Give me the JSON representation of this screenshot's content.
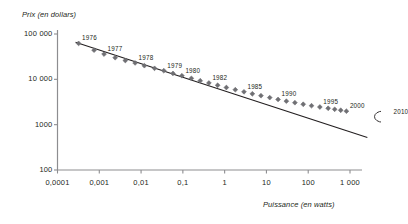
{
  "chart_data": {
    "type": "scatter",
    "title": "",
    "xlabel": "Puissance (en watts)",
    "ylabel": "Prix (en dollars)",
    "xscale": "log",
    "yscale": "log",
    "xlim": [
      0.0001,
      3000
    ],
    "ylim": [
      100,
      100000
    ],
    "grid": false,
    "legend": null,
    "xticks": [
      {
        "value": 0.0001,
        "label": "0,0001"
      },
      {
        "value": 0.001,
        "label": "0,001"
      },
      {
        "value": 0.01,
        "label": "0,01"
      },
      {
        "value": 0.1,
        "label": "0,1"
      },
      {
        "value": 1,
        "label": "1"
      },
      {
        "value": 10,
        "label": "10"
      },
      {
        "value": 100,
        "label": "100"
      },
      {
        "value": 1000,
        "label": "1 000"
      }
    ],
    "yticks": [
      {
        "value": 100000,
        "label": "100 000"
      },
      {
        "value": 10000,
        "label": "10 000"
      },
      {
        "value": 1000,
        "label": "1000"
      },
      {
        "value": 100,
        "label": "100"
      }
    ],
    "series": [
      {
        "name": "Prix observe",
        "marker": "diamond",
        "color": "#6f6f73",
        "points": [
          {
            "x": 0.00032,
            "y": 62000,
            "label": "1976"
          },
          {
            "x": 0.00075,
            "y": 44000,
            "label": ""
          },
          {
            "x": 0.0013,
            "y": 36000,
            "label": "1977"
          },
          {
            "x": 0.0024,
            "y": 30000,
            "label": ""
          },
          {
            "x": 0.0042,
            "y": 26000,
            "label": ""
          },
          {
            "x": 0.0072,
            "y": 23000,
            "label": "1978"
          },
          {
            "x": 0.012,
            "y": 20000,
            "label": ""
          },
          {
            "x": 0.021,
            "y": 17500,
            "label": ""
          },
          {
            "x": 0.035,
            "y": 15500,
            "label": "1979"
          },
          {
            "x": 0.058,
            "y": 13500,
            "label": ""
          },
          {
            "x": 0.095,
            "y": 12000,
            "label": "1980"
          },
          {
            "x": 0.16,
            "y": 10500,
            "label": ""
          },
          {
            "x": 0.26,
            "y": 9300,
            "label": ""
          },
          {
            "x": 0.42,
            "y": 8300,
            "label": "1982"
          },
          {
            "x": 0.68,
            "y": 7400,
            "label": ""
          },
          {
            "x": 1.1,
            "y": 6600,
            "label": ""
          },
          {
            "x": 1.8,
            "y": 5900,
            "label": ""
          },
          {
            "x": 2.9,
            "y": 5300,
            "label": "1985"
          },
          {
            "x": 4.6,
            "y": 4800,
            "label": ""
          },
          {
            "x": 7.4,
            "y": 4350,
            "label": ""
          },
          {
            "x": 12,
            "y": 3950,
            "label": ""
          },
          {
            "x": 19,
            "y": 3600,
            "label": "1990"
          },
          {
            "x": 30,
            "y": 3300,
            "label": ""
          },
          {
            "x": 48,
            "y": 3050,
            "label": ""
          },
          {
            "x": 76,
            "y": 2820,
            "label": ""
          },
          {
            "x": 120,
            "y": 2620,
            "label": ""
          },
          {
            "x": 190,
            "y": 2450,
            "label": "1995"
          },
          {
            "x": 300,
            "y": 2300,
            "label": ""
          },
          {
            "x": 430,
            "y": 2180,
            "label": ""
          },
          {
            "x": 600,
            "y": 2080,
            "label": ""
          },
          {
            "x": 820,
            "y": 1980,
            "label": "2000"
          }
        ]
      },
      {
        "name": "Projection",
        "marker": "open-circle",
        "color": "#231f20",
        "points": [
          {
            "x": 6000,
            "y": 1500,
            "label": "2010"
          }
        ]
      }
    ],
    "trendline": {
      "name": "Tendance",
      "color": "#231f20",
      "from": {
        "x": 0.00027,
        "y": 66000
      },
      "to": {
        "x": 2600,
        "y": 520
      }
    },
    "annotations": [
      {
        "text": "1976",
        "x": 0.00032,
        "y": 62000
      },
      {
        "text": "1977",
        "x": 0.0013,
        "y": 36000
      },
      {
        "text": "1978",
        "x": 0.0072,
        "y": 23000
      },
      {
        "text": "1979",
        "x": 0.035,
        "y": 15500
      },
      {
        "text": "1980",
        "x": 0.095,
        "y": 12000
      },
      {
        "text": "1982",
        "x": 0.42,
        "y": 8300
      },
      {
        "text": "1985",
        "x": 2.9,
        "y": 5300
      },
      {
        "text": "1990",
        "x": 19,
        "y": 3600
      },
      {
        "text": "1995",
        "x": 190,
        "y": 2450
      },
      {
        "text": "2000",
        "x": 820,
        "y": 1980
      },
      {
        "text": "2010",
        "x": 6000,
        "y": 1500
      }
    ]
  }
}
